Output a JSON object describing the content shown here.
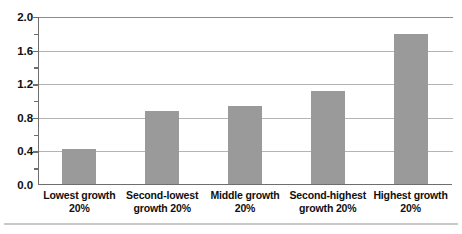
{
  "chart_data": {
    "type": "bar",
    "title": "",
    "subtitle": "",
    "xlabel": "",
    "ylabel": "",
    "categories": [
      "Lowest growth 20%",
      "Second-lowest growth 20%",
      "Middle growth 20%",
      "Second-highest growth 20%",
      "Highest growth 20%"
    ],
    "category_lines": [
      [
        "Lowest growth",
        "20%"
      ],
      [
        "Second-lowest",
        "growth 20%"
      ],
      [
        "Middle growth",
        "20%"
      ],
      [
        "Second-highest",
        "growth 20%"
      ],
      [
        "Highest growth",
        "20%"
      ]
    ],
    "values": [
      0.42,
      0.87,
      0.94,
      1.11,
      1.8
    ],
    "ylim": [
      0.0,
      2.0
    ],
    "ytick_labels": [
      "0.0",
      "0.4",
      "0.8",
      "1.2",
      "1.6",
      "2.0"
    ],
    "ytick_values": [
      0.0,
      0.4,
      0.8,
      1.2,
      1.6,
      2.0
    ],
    "yminor_tick_values": [
      0.2,
      0.6,
      1.0,
      1.4,
      1.8
    ],
    "grid": true,
    "grid_axis": "y",
    "legend": false,
    "legend_position": "none",
    "bar_color": "#9a9a9a",
    "grid_color": "#b4b4b4",
    "axis_color": "#6e6e6e",
    "background_color": "#ffffff"
  }
}
